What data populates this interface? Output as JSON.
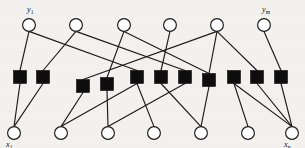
{
  "figure": {
    "type": "bipartite-graph",
    "width": 305,
    "height": 148,
    "background_color": "#f3f1ee",
    "line_color": "#1b1b1b",
    "check_node_color": "#0d0d0d",
    "variable_node_fill": "#ffffff"
  },
  "labels": {
    "top_left": {
      "text": "y",
      "sub": "1",
      "x": 27,
      "y": 12
    },
    "top_right": {
      "text": "y",
      "sub": "m",
      "x": 262,
      "y": 12
    },
    "bottom_left": {
      "text": "x",
      "sub": "1",
      "x": 6,
      "y": 147
    },
    "bottom_right": {
      "text": "x",
      "sub": "n",
      "x": 284,
      "y": 147
    }
  },
  "top_nodes": {
    "name": "output-nodes",
    "shape": "circle",
    "radius": 6.4,
    "cy": 25,
    "items": [
      {
        "id": "y1",
        "cx": 29
      },
      {
        "id": "y2",
        "cx": 76
      },
      {
        "id": "y3",
        "cx": 124
      },
      {
        "id": "y4",
        "cx": 170
      },
      {
        "id": "y5",
        "cx": 217
      },
      {
        "id": "ym",
        "cx": 264
      }
    ]
  },
  "bottom_nodes": {
    "name": "input-nodes",
    "shape": "circle",
    "radius": 6.4,
    "cy": 133,
    "items": [
      {
        "id": "x1",
        "cx": 14
      },
      {
        "id": "x2",
        "cx": 61
      },
      {
        "id": "x3",
        "cx": 108
      },
      {
        "id": "x4",
        "cx": 154
      },
      {
        "id": "x5",
        "cx": 201
      },
      {
        "id": "x6",
        "cx": 248
      },
      {
        "id": "xn",
        "cx": 292
      }
    ]
  },
  "check_nodes": {
    "name": "check-nodes",
    "shape": "square",
    "size": 13,
    "items": [
      {
        "id": "c1",
        "cx": 20,
        "cy": 77
      },
      {
        "id": "c2",
        "cx": 43,
        "cy": 77
      },
      {
        "id": "c3",
        "cx": 83,
        "cy": 86
      },
      {
        "id": "c4",
        "cx": 107,
        "cy": 84
      },
      {
        "id": "c5",
        "cx": 137,
        "cy": 77
      },
      {
        "id": "c6",
        "cx": 161,
        "cy": 77
      },
      {
        "id": "c7",
        "cx": 185,
        "cy": 77
      },
      {
        "id": "c8",
        "cx": 209,
        "cy": 80
      },
      {
        "id": "c9",
        "cx": 234,
        "cy": 77
      },
      {
        "id": "c10",
        "cx": 257,
        "cy": 77
      },
      {
        "id": "c11",
        "cx": 281,
        "cy": 77
      }
    ]
  },
  "edges_top": {
    "name": "edges-top-to-check",
    "items": [
      {
        "from": "y1",
        "to": "c1"
      },
      {
        "from": "y1",
        "to": "c5"
      },
      {
        "from": "y2",
        "to": "c2"
      },
      {
        "from": "y2",
        "to": "c7"
      },
      {
        "from": "y3",
        "to": "c4"
      },
      {
        "from": "y3",
        "to": "c8"
      },
      {
        "from": "y4",
        "to": "c6"
      },
      {
        "from": "y5",
        "to": "c3"
      },
      {
        "from": "y5",
        "to": "c8"
      },
      {
        "from": "y5",
        "to": "c10"
      },
      {
        "from": "ym",
        "to": "c11"
      }
    ]
  },
  "edges_bottom": {
    "name": "edges-check-to-bottom",
    "items": [
      {
        "from": "c1",
        "to": "x1"
      },
      {
        "from": "c2",
        "to": "x1"
      },
      {
        "from": "c3",
        "to": "x2"
      },
      {
        "from": "c4",
        "to": "x3"
      },
      {
        "from": "c5",
        "to": "x4"
      },
      {
        "from": "c6",
        "to": "x5"
      },
      {
        "from": "c7",
        "to": "x3"
      },
      {
        "from": "c8",
        "to": "x5"
      },
      {
        "from": "c9",
        "to": "x6"
      },
      {
        "from": "c10",
        "to": "xn"
      },
      {
        "from": "c11",
        "to": "xn"
      },
      {
        "from": "c5",
        "to": "x2"
      },
      {
        "from": "c9",
        "to": "xn"
      }
    ]
  },
  "edges_crossing": {
    "name": "edges-crossing",
    "items": [
      {
        "x1": 29,
        "y1": 31.4,
        "x2": 137,
        "y2": 71
      },
      {
        "x1": 76,
        "y1": 31.4,
        "x2": 185,
        "y2": 71
      },
      {
        "x1": 124,
        "y1": 31.4,
        "x2": 209,
        "y2": 74
      },
      {
        "x1": 170,
        "y1": 31.4,
        "x2": 161,
        "y2": 71
      },
      {
        "x1": 217,
        "y1": 31.4,
        "x2": 83,
        "y2": 80
      },
      {
        "x1": 217,
        "y1": 31.4,
        "x2": 209,
        "y2": 74
      },
      {
        "x1": 217,
        "y1": 31.4,
        "x2": 257,
        "y2": 71
      },
      {
        "x1": 264,
        "y1": 31.4,
        "x2": 281,
        "y2": 71
      },
      {
        "x1": 29,
        "y1": 31.4,
        "x2": 20,
        "y2": 71
      },
      {
        "x1": 76,
        "y1": 31.4,
        "x2": 43,
        "y2": 71
      },
      {
        "x1": 124,
        "y1": 31.4,
        "x2": 107,
        "y2": 78
      }
    ]
  }
}
